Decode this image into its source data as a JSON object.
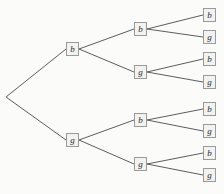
{
  "figure": {
    "name": "binary-probability-tree",
    "type": "tree-diagram",
    "levels": 3,
    "background_color": "#fbfbfa",
    "edge_color": "#4a4a4a",
    "node_border_color": "#9a9a9a",
    "node_fill_color": "#f2f2f1",
    "node_text_color": "#2b2b2b"
  },
  "root": {
    "label": "",
    "boxed": false,
    "x": 6,
    "y": 97
  },
  "level1": [
    {
      "id": "b",
      "label": "b",
      "x": 66,
      "y": 42
    },
    {
      "id": "g",
      "label": "g",
      "x": 66,
      "y": 133
    }
  ],
  "level2": [
    {
      "id": "bb",
      "label": "b",
      "x": 134,
      "y": 22
    },
    {
      "id": "bg",
      "label": "g",
      "x": 134,
      "y": 65
    },
    {
      "id": "gb",
      "label": "b",
      "x": 134,
      "y": 113
    },
    {
      "id": "gg",
      "label": "g",
      "x": 134,
      "y": 157
    }
  ],
  "level3": [
    {
      "id": "bbb",
      "label": "b",
      "x": 203,
      "y": 8
    },
    {
      "id": "bbg",
      "label": "g",
      "x": 203,
      "y": 30
    },
    {
      "id": "bgb",
      "label": "b",
      "x": 203,
      "y": 52
    },
    {
      "id": "bgg",
      "label": "g",
      "x": 203,
      "y": 75
    },
    {
      "id": "gbb",
      "label": "b",
      "x": 203,
      "y": 102
    },
    {
      "id": "gbg",
      "label": "g",
      "x": 203,
      "y": 124
    },
    {
      "id": "ggb",
      "label": "b",
      "x": 203,
      "y": 146
    },
    {
      "id": "ggg",
      "label": "g",
      "x": 203,
      "y": 168
    }
  ],
  "edges": [
    {
      "from": "root",
      "to": "b",
      "x1": 6,
      "y1": 97,
      "x2": 66,
      "y2": 49
    },
    {
      "from": "root",
      "to": "g",
      "x1": 6,
      "y1": 97,
      "x2": 66,
      "y2": 140
    },
    {
      "from": "b",
      "to": "bb",
      "x1": 79,
      "y1": 49,
      "x2": 134,
      "y2": 29
    },
    {
      "from": "b",
      "to": "bg",
      "x1": 79,
      "y1": 49,
      "x2": 134,
      "y2": 72
    },
    {
      "from": "g",
      "to": "gb",
      "x1": 79,
      "y1": 140,
      "x2": 134,
      "y2": 120
    },
    {
      "from": "g",
      "to": "gg",
      "x1": 79,
      "y1": 140,
      "x2": 134,
      "y2": 164
    },
    {
      "from": "bb",
      "to": "bbb",
      "x1": 147,
      "y1": 29,
      "x2": 203,
      "y2": 15
    },
    {
      "from": "bb",
      "to": "bbg",
      "x1": 147,
      "y1": 29,
      "x2": 203,
      "y2": 37
    },
    {
      "from": "bg",
      "to": "bgb",
      "x1": 147,
      "y1": 72,
      "x2": 203,
      "y2": 59
    },
    {
      "from": "bg",
      "to": "bgg",
      "x1": 147,
      "y1": 72,
      "x2": 203,
      "y2": 82
    },
    {
      "from": "gb",
      "to": "gbb",
      "x1": 147,
      "y1": 120,
      "x2": 203,
      "y2": 109
    },
    {
      "from": "gb",
      "to": "gbg",
      "x1": 147,
      "y1": 120,
      "x2": 203,
      "y2": 131
    },
    {
      "from": "gg",
      "to": "ggb",
      "x1": 147,
      "y1": 164,
      "x2": 203,
      "y2": 153
    },
    {
      "from": "gg",
      "to": "ggg",
      "x1": 147,
      "y1": 164,
      "x2": 203,
      "y2": 175
    }
  ]
}
